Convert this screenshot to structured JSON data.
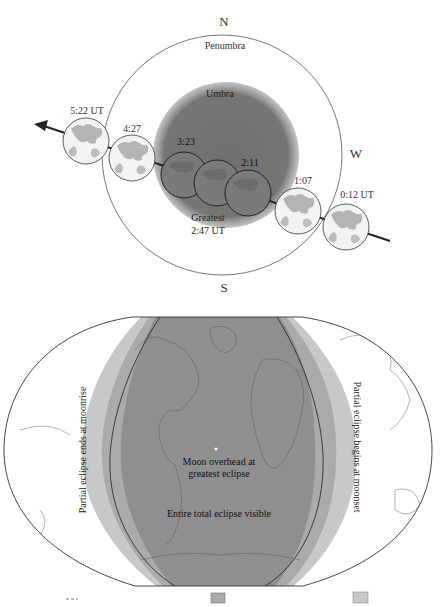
{
  "diagram": {
    "compass": {
      "north": "N",
      "south": "S",
      "west": "W"
    },
    "regions": {
      "penumbra": "Penumbra",
      "umbra": "Umbra"
    },
    "moon_positions": [
      {
        "time": "0:12 UT",
        "phase": "penumbral"
      },
      {
        "time": "1:07",
        "phase": "partial"
      },
      {
        "time": "2:11",
        "phase": "total"
      },
      {
        "time": "Greatest",
        "time2": "2:47 UT",
        "phase": "greatest"
      },
      {
        "time": "3:23",
        "phase": "total"
      },
      {
        "time": "4:27",
        "phase": "partial"
      },
      {
        "time": "5:22 UT",
        "phase": "penumbral"
      }
    ]
  },
  "map": {
    "labels": {
      "left_band": "Partial eclipse ends at moonrise",
      "right_band": "Partial eclipse begins at moonset",
      "moon_overhead_line1": "Moon overhead at",
      "moon_overhead_line2": "greatest eclipse",
      "center": "Entire total eclipse visible"
    },
    "colors": {
      "band_light": "#c8c8c8",
      "band_medium": "#aaaaaa",
      "band_dark": "#8f8f8f",
      "umbra": "#6e6e6e",
      "moon_light": "#f4f4f4",
      "moon_maria": "#b8b8b8"
    }
  },
  "legend": {
    "items": [
      {
        "swatch": "dashed-line"
      },
      {
        "swatch": "medium-gray-box"
      },
      {
        "swatch": "light-gray-box"
      }
    ]
  }
}
